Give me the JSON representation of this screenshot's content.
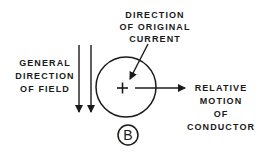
{
  "diagram": {
    "panel_label": "B",
    "labels": {
      "current": [
        "DIRECTION",
        "OF ORIGINAL",
        "CURRENT"
      ],
      "field": [
        "GENERAL",
        "DIRECTION",
        "OF FIELD"
      ],
      "motion": [
        "RELATIVE",
        "MOTION",
        "OF",
        "CONDUCTOR"
      ]
    },
    "conductor_symbol": "+",
    "colors": {
      "ink": "#1a1a1a",
      "background": "#ffffff"
    }
  }
}
